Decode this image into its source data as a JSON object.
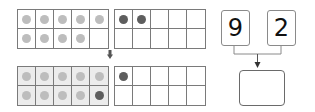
{
  "colors": {
    "grid_line": "#7a7a7a",
    "dot_light": "#bdbdbd",
    "dot_dark": "#5e5e5e",
    "shaded_fill": "#ececec"
  },
  "top_row": {
    "left_frame": {
      "shaded": false,
      "cells": [
        "light",
        "light",
        "light",
        "light",
        "light",
        "light",
        "light",
        "light",
        "light",
        ""
      ]
    },
    "right_frame": {
      "shaded": false,
      "cells": [
        "dark",
        "dark",
        "",
        "",
        "",
        "",
        "",
        "",
        "",
        ""
      ]
    }
  },
  "bottom_row": {
    "left_frame": {
      "shaded": true,
      "cells": [
        "light",
        "light",
        "light",
        "light",
        "light",
        "light",
        "light",
        "light",
        "light",
        "dark"
      ]
    },
    "right_frame": {
      "shaded": false,
      "cells": [
        "dark",
        "",
        "",
        "",
        "",
        "",
        "",
        "",
        "",
        ""
      ]
    }
  },
  "arrow_icon": "arrow-down-icon",
  "number_bond": {
    "left_number": "9",
    "right_number": "2",
    "answer": ""
  }
}
